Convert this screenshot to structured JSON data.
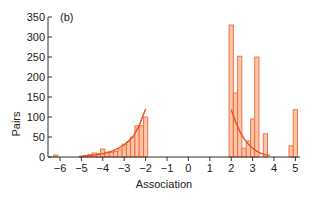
{
  "chart_data": {
    "type": "bar",
    "panel_label": "(b)",
    "title": "",
    "xlabel": "Association",
    "ylabel": "Pairs",
    "xlim": [
      -6.5,
      5.6
    ],
    "ylim": [
      0,
      350
    ],
    "x_ticks": [
      -6,
      -5,
      -4,
      -3,
      -2,
      -1,
      0,
      1,
      2,
      3,
      4,
      5
    ],
    "x_tick_labels": [
      "−6",
      "−5",
      "−4",
      "−3",
      "−2",
      "−1",
      "0",
      "1",
      "2",
      "3",
      "4",
      "5"
    ],
    "y_ticks": [
      0,
      50,
      100,
      150,
      200,
      250,
      300,
      350
    ],
    "y_tick_labels": [
      "0",
      "50",
      "100",
      "150",
      "200",
      "250",
      "300",
      "350"
    ],
    "grid": false,
    "bar_width": 0.2,
    "bars": [
      {
        "x": -6.2,
        "y": 5
      },
      {
        "x": -5.0,
        "y": 2
      },
      {
        "x": -4.8,
        "y": 4
      },
      {
        "x": -4.6,
        "y": 6
      },
      {
        "x": -4.4,
        "y": 10
      },
      {
        "x": -4.2,
        "y": 8
      },
      {
        "x": -4.0,
        "y": 20
      },
      {
        "x": -3.8,
        "y": 12
      },
      {
        "x": -3.6,
        "y": 11
      },
      {
        "x": -3.4,
        "y": 14
      },
      {
        "x": -3.2,
        "y": 20
      },
      {
        "x": -3.0,
        "y": 32
      },
      {
        "x": -2.8,
        "y": 38
      },
      {
        "x": -2.6,
        "y": 50
      },
      {
        "x": -2.4,
        "y": 78
      },
      {
        "x": -2.2,
        "y": 78
      },
      {
        "x": -2.0,
        "y": 100
      },
      {
        "x": 2.0,
        "y": 330
      },
      {
        "x": 2.2,
        "y": 160
      },
      {
        "x": 2.4,
        "y": 252
      },
      {
        "x": 2.6,
        "y": 22
      },
      {
        "x": 2.8,
        "y": 40
      },
      {
        "x": 3.0,
        "y": 95
      },
      {
        "x": 3.2,
        "y": 250
      },
      {
        "x": 3.6,
        "y": 58
      },
      {
        "x": 4.8,
        "y": 28
      },
      {
        "x": 5.0,
        "y": 118
      }
    ],
    "fit_curves": [
      {
        "name": "negative fit",
        "points": [
          [
            -5.1,
            1
          ],
          [
            -4.5,
            4
          ],
          [
            -4.0,
            8
          ],
          [
            -3.5,
            16
          ],
          [
            -3.0,
            30
          ],
          [
            -2.6,
            50
          ],
          [
            -2.3,
            78
          ],
          [
            -2.0,
            120
          ]
        ]
      },
      {
        "name": "positive fit",
        "points": [
          [
            2.0,
            118
          ],
          [
            2.2,
            88
          ],
          [
            2.4,
            64
          ],
          [
            2.6,
            46
          ],
          [
            2.8,
            32
          ],
          [
            3.0,
            22
          ],
          [
            3.2,
            14
          ],
          [
            3.4,
            9
          ],
          [
            3.6,
            6
          ],
          [
            3.8,
            4
          ]
        ]
      }
    ],
    "colors": {
      "bar_fill": "#fbc4a6",
      "bar_edge": "#ee6a3c",
      "fit_line": "#e8501f",
      "axis": "#333333"
    }
  }
}
